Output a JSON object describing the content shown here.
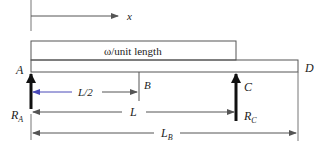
{
  "diagram": {
    "type": "beam-loading",
    "axis": {
      "label": "x"
    },
    "distributed_load": {
      "label": "ω/unit length"
    },
    "points": {
      "A": "A",
      "B": "B",
      "C": "C",
      "D": "D"
    },
    "reactions": {
      "RA": {
        "main": "R",
        "sub": "A"
      },
      "RC": {
        "main": "R",
        "sub": "C"
      }
    },
    "dimensions": {
      "half": "L/2",
      "L": "L",
      "LB": {
        "main": "L",
        "sub": "B"
      }
    },
    "colors": {
      "line": "#555555",
      "arrow": "#111111",
      "dim_half": "#4a4ab8",
      "text": "#222222"
    }
  }
}
